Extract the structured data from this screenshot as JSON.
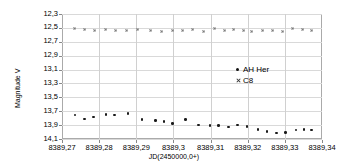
{
  "chart_data": {
    "type": "scatter",
    "title": "",
    "xlabel": "JD(2450000,0+)",
    "ylabel": "Magnitude V",
    "xlim": [
      8389.27,
      8389.34
    ],
    "ylim": [
      12.3,
      14.1
    ],
    "y_inverted": true,
    "grid": true,
    "legend_position": "inside-right",
    "xticks": [
      "8389,27",
      "8389,28",
      "8389,29",
      "8389,3",
      "8389,31",
      "8389,32",
      "8389,33",
      "8389,34"
    ],
    "xtick_values": [
      8389.27,
      8389.28,
      8389.29,
      8389.3,
      8389.31,
      8389.32,
      8389.33,
      8389.34
    ],
    "yticks": [
      "12,3",
      "12,5",
      "12,7",
      "12,9",
      "13,1",
      "13,3",
      "13,5",
      "13,7",
      "13,9",
      "14,1"
    ],
    "ytick_values": [
      12.3,
      12.5,
      12.7,
      12.9,
      13.1,
      13.3,
      13.5,
      13.7,
      13.9,
      14.1
    ],
    "series": [
      {
        "name": "AH Her",
        "marker": "filled-circle",
        "color": "#1a1a1a",
        "x": [
          8389.2735,
          8389.276,
          8389.2785,
          8389.2818,
          8389.2842,
          8389.2878,
          8389.2915,
          8389.2952,
          8389.2975,
          8389.2998,
          8389.3032,
          8389.3068,
          8389.3098,
          8389.3122,
          8389.3148,
          8389.3172,
          8389.3198,
          8389.3228,
          8389.3252,
          8389.3278,
          8389.3302,
          8389.333,
          8389.3352,
          8389.3372
        ],
        "y": [
          13.755,
          13.81,
          13.785,
          13.745,
          13.752,
          13.735,
          13.82,
          13.83,
          13.848,
          13.875,
          13.822,
          13.9,
          13.902,
          13.905,
          13.93,
          13.9,
          13.922,
          13.96,
          13.99,
          14.012,
          14.008,
          13.968,
          13.965,
          13.972
        ]
      },
      {
        "name": "C8",
        "marker": "cross",
        "color": "#7a7a7a",
        "x": [
          8389.2735,
          8389.276,
          8389.2788,
          8389.2818,
          8389.2845,
          8389.2875,
          8389.2905,
          8389.2938,
          8389.2968,
          8389.2998,
          8389.3025,
          8389.3052,
          8389.3082,
          8389.3112,
          8389.3138,
          8389.3162,
          8389.3188,
          8389.3212,
          8389.324,
          8389.3268,
          8389.3295,
          8389.3322,
          8389.3348,
          8389.3372
        ],
        "y": [
          12.51,
          12.512,
          12.538,
          12.522,
          12.525,
          12.528,
          12.522,
          12.525,
          12.548,
          12.535,
          12.532,
          12.515,
          12.54,
          12.505,
          12.532,
          12.518,
          12.528,
          12.54,
          12.532,
          12.525,
          12.54,
          12.505,
          12.52,
          12.528
        ]
      }
    ]
  },
  "legend": {
    "entries": [
      {
        "label": "AH Her",
        "marker": "filled-circle"
      },
      {
        "label": "C8",
        "marker": "cross"
      }
    ]
  }
}
